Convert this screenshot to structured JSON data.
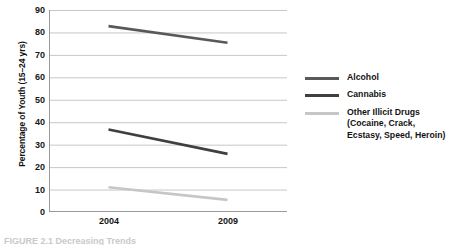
{
  "figure": {
    "caption": "FIGURE 2.1  Decreasing Trends"
  },
  "axes": {
    "y_title": "Percentage of Youth (15–24 yrs)",
    "y_ticks": [
      "90",
      "80",
      "70",
      "60",
      "50",
      "40",
      "30",
      "20",
      "10",
      "0"
    ],
    "x_ticks": [
      "2004",
      "2009"
    ]
  },
  "legend": {
    "entries": [
      {
        "label": "Alcohol",
        "color": "#595959"
      },
      {
        "label": "Cannabis",
        "color": "#3f3f3f"
      },
      {
        "label": "Other Illicit Drugs\n(Cocaine, Crack,\nEcstasy, Speed, Heroin)",
        "color": "#c6c6c6"
      }
    ]
  },
  "chart_data": {
    "type": "line",
    "title": "",
    "xlabel": "",
    "ylabel": "Percentage of Youth (15–24 yrs)",
    "categories": [
      "2004",
      "2009"
    ],
    "x": [
      2004,
      2009
    ],
    "ylim": [
      0,
      90
    ],
    "ytick_step": 10,
    "grid": true,
    "legend_position": "right",
    "series": [
      {
        "name": "Alcohol",
        "values": [
          82.8,
          75.4
        ],
        "color": "#595959"
      },
      {
        "name": "Cannabis",
        "values": [
          36.8,
          25.9
        ],
        "color": "#3f3f3f"
      },
      {
        "name": "Other Illicit Drugs (Cocaine, Crack, Ecstasy, Speed, Heroin)",
        "values": [
          11.0,
          5.4
        ],
        "color": "#c6c6c6"
      }
    ]
  }
}
